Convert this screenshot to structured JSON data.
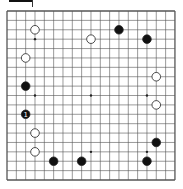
{
  "board": {
    "size": 19,
    "origin": [
      7,
      11
    ],
    "spacing": [
      9.33,
      9.39
    ],
    "line_color": "#555555",
    "star_points": [
      [
        3,
        3
      ],
      [
        9,
        3
      ],
      [
        15,
        3
      ],
      [
        3,
        9
      ],
      [
        9,
        9
      ],
      [
        15,
        9
      ],
      [
        3,
        15
      ],
      [
        9,
        15
      ],
      [
        15,
        15
      ]
    ]
  },
  "stones": [
    {
      "color": "white",
      "x": 3,
      "y": 2
    },
    {
      "color": "white",
      "x": 9,
      "y": 3
    },
    {
      "color": "black",
      "x": 12,
      "y": 2
    },
    {
      "color": "black",
      "x": 15,
      "y": 3
    },
    {
      "color": "white",
      "x": 2,
      "y": 5
    },
    {
      "color": "black",
      "x": 2,
      "y": 8
    },
    {
      "color": "white",
      "x": 16,
      "y": 7
    },
    {
      "color": "white",
      "x": 16,
      "y": 10
    },
    {
      "color": "black",
      "x": 2,
      "y": 11,
      "label": "1"
    },
    {
      "color": "white",
      "x": 3,
      "y": 13
    },
    {
      "color": "white",
      "x": 3,
      "y": 15
    },
    {
      "color": "black",
      "x": 16,
      "y": 14
    },
    {
      "color": "black",
      "x": 5,
      "y": 16
    },
    {
      "color": "black",
      "x": 8,
      "y": 16
    },
    {
      "color": "black",
      "x": 15,
      "y": 16
    }
  ]
}
